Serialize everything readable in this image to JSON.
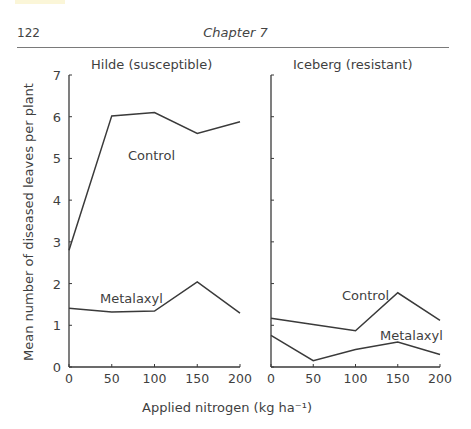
{
  "header": {
    "page_number": "122",
    "chapter": "Chapter 7"
  },
  "chart_data": {
    "type": "line",
    "ylabel": "Mean number of diseased leaves per plant",
    "xlabel": "Applied nitrogen (kg ha⁻¹)",
    "ylim": [
      0,
      7
    ],
    "yticks": [
      0,
      1,
      2,
      3,
      4,
      5,
      6,
      7
    ],
    "xticks": [
      0,
      50,
      100,
      150,
      200
    ],
    "grid": false,
    "panels": [
      {
        "title": "Hilde (susceptible)",
        "x": [
          0,
          50,
          100,
          150,
          200
        ],
        "series": [
          {
            "name": "Control",
            "values": [
              2.8,
              6.02,
              6.1,
              5.6,
              5.88
            ]
          },
          {
            "name": "Metalaxyl",
            "values": [
              1.41,
              1.32,
              1.34,
              2.04,
              1.29
            ]
          }
        ]
      },
      {
        "title": "Iceberg (resistant)",
        "x": [
          0,
          50,
          100,
          150,
          200
        ],
        "series": [
          {
            "name": "Control",
            "values": [
              1.17,
              1.02,
              0.87,
              1.78,
              1.12
            ]
          },
          {
            "name": "Metalaxyl",
            "values": [
              0.76,
              0.15,
              0.42,
              0.6,
              0.3
            ]
          }
        ]
      }
    ]
  },
  "colors": {
    "line": "#3a3a3a",
    "axis": "#3a3a3a",
    "text": "#3f3f3f"
  }
}
